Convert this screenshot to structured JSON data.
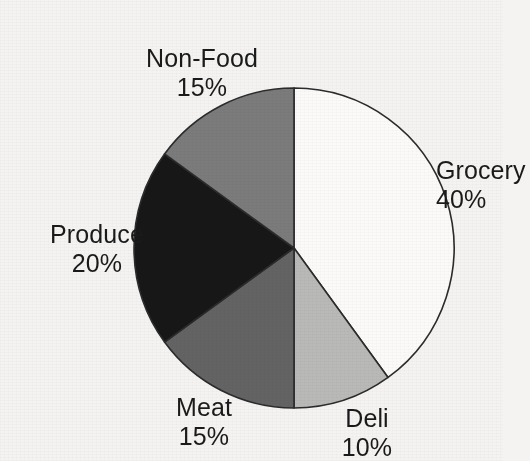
{
  "chart_data": {
    "type": "pie",
    "title": "",
    "subtitle": "",
    "xlabel": "",
    "ylabel": "",
    "legend_position": "none",
    "grid": false,
    "start_angle_deg": 0,
    "direction": "clockwise",
    "categories": [
      "Grocery",
      "Deli",
      "Meat",
      "Produce",
      "Non-Food"
    ],
    "values": [
      40,
      10,
      15,
      20,
      15
    ],
    "value_suffix": "%",
    "slices": [
      {
        "name": "Grocery",
        "value": 40,
        "label_name": "Grocery",
        "label_value": "40%",
        "color": "#fbfaf8",
        "start_deg": 0,
        "end_deg": 144
      },
      {
        "name": "Deli",
        "value": 10,
        "label_name": "Deli",
        "label_value": "10%",
        "color": "#b9b9b7",
        "start_deg": 144,
        "end_deg": 180
      },
      {
        "name": "Meat",
        "value": 15,
        "label_name": "Meat",
        "label_value": "15%",
        "color": "#636363",
        "start_deg": 180,
        "end_deg": 234
      },
      {
        "name": "Produce",
        "value": 20,
        "label_name": "Produce",
        "label_value": "20%",
        "color": "#171717",
        "start_deg": 234,
        "end_deg": 306
      },
      {
        "name": "Non-Food",
        "value": 15,
        "label_name": "Non-Food",
        "label_value": "15%",
        "color": "#7b7b7b",
        "start_deg": 306,
        "end_deg": 360
      }
    ],
    "geometry": {
      "center_x": 254,
      "center_y": 232,
      "radius": 160
    },
    "style": {
      "background": "#f4f3f1",
      "outline": "#2b2b2b",
      "text": "#1a1a1a"
    }
  }
}
